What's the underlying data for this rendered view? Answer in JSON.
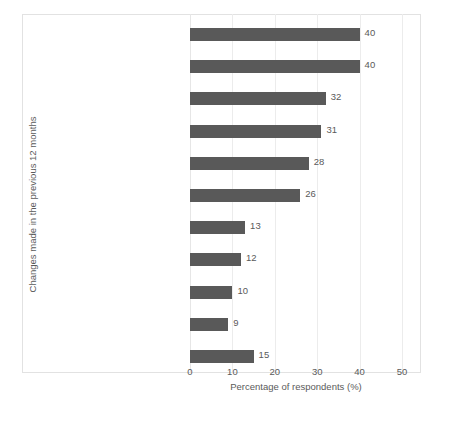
{
  "chart_data": {
    "type": "bar",
    "orientation": "horizontal",
    "title": "",
    "xlabel": "Percentage of respondents (%)",
    "ylabel": "Changes made in the previous 12 months",
    "xlim": [
      0,
      50
    ],
    "xticks": [
      0,
      10,
      20,
      30,
      40,
      50
    ],
    "grid": true,
    "legend": false,
    "bar_color": "#595959",
    "categories": [
      "Eaten less processed food",
      "Started minimising food waste",
      "Started eating more fruit and/or vegetables",
      "Started buying foods with minimal or no packaging",
      "Eaten less meat, poultry or fish",
      "Started buying locally produced food or food that is in season",
      "Eaten/drunk less dairy",
      "Started growing fruit and/or vegetables",
      "Started buying fair trade products",
      "Started buying sustainably sourced fish",
      "None of these"
    ],
    "category_lines": [
      [
        "Eaten less processed food"
      ],
      [
        "Started minimising food waste"
      ],
      [
        "Started eating more fruit",
        "and/or vegetables"
      ],
      [
        "Started buying foods with",
        "minimal or no packaging"
      ],
      [
        "Eaten less meat, poultry or fish"
      ],
      [
        "Started buying locally produced",
        "food or food that is in season"
      ],
      [
        "Eaten/drunk less dairy"
      ],
      [
        "Started growing fruit",
        "and/or vegetables"
      ],
      [
        "Started buying fair trade products"
      ],
      [
        "Started buying sustainably sourced fish"
      ],
      [
        "None of these"
      ]
    ],
    "values": [
      40,
      40,
      32,
      31,
      28,
      26,
      13,
      12,
      10,
      9,
      15
    ],
    "value_labels": [
      "40",
      "40",
      "32",
      "31",
      "28",
      "26",
      "13",
      "12",
      "10",
      "9",
      "15"
    ],
    "xtick_labels": [
      "0",
      "10",
      "20",
      "30",
      "40",
      "50"
    ]
  }
}
